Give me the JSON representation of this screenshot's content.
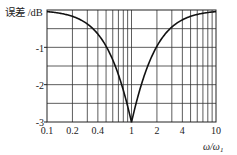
{
  "chart_data": {
    "type": "line",
    "title": "",
    "ylabel": "误差 /dB",
    "xlabel": "ω/ω₁",
    "xscale": "log",
    "xlim": [
      0.1,
      10
    ],
    "ylim": [
      -3,
      0
    ],
    "x_ticks": [
      "0.1",
      "0.2",
      "0.4",
      "1",
      "2",
      "4",
      "10"
    ],
    "y_ticks": [
      "0",
      "-1",
      "-2",
      "-3"
    ],
    "grid": true,
    "legend": null,
    "series": [
      {
        "name": "error",
        "x": [
          0.1,
          0.2,
          0.3,
          0.4,
          0.5,
          0.6,
          0.7,
          0.8,
          0.9,
          1.0,
          1.111,
          1.25,
          1.429,
          1.667,
          2.0,
          2.5,
          3.333,
          5.0,
          10.0
        ],
        "values": [
          -0.04,
          -0.17,
          -0.37,
          -0.64,
          -0.97,
          -1.34,
          -1.73,
          -2.15,
          -2.58,
          -3.01,
          -2.58,
          -2.15,
          -1.73,
          -1.34,
          -0.97,
          -0.64,
          -0.37,
          -0.17,
          -0.04
        ]
      }
    ]
  },
  "labels": {
    "ylabel": "误差 /dB",
    "xlabel_main": "ω/ω",
    "xlabel_sub": "1",
    "yticks": [
      "-1",
      "-2",
      "-3"
    ],
    "xticks": [
      "0.1",
      "0.2",
      "0.4",
      "1",
      "2",
      "4",
      "10"
    ]
  }
}
